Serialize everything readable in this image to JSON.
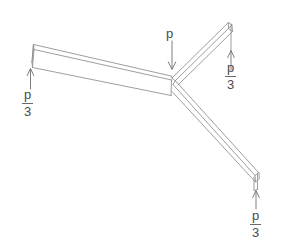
{
  "figure": {
    "type": "engineering-free-body-diagram",
    "title": "",
    "background_color": "#ffffff",
    "line_color": "#8c8c8c",
    "text_color": "#4a4a4a"
  },
  "load": {
    "label": "p",
    "direction": "down",
    "arrow_glyph": "↓"
  },
  "reactions": [
    {
      "id": "left",
      "numerator": "p",
      "denominator": "3",
      "direction": "up",
      "arrow_glyph": "↑"
    },
    {
      "id": "upper-right",
      "numerator": "p",
      "denominator": "3",
      "direction": "up",
      "arrow_glyph": "↑"
    },
    {
      "id": "lower-right",
      "numerator": "p",
      "denominator": "3",
      "direction": "up",
      "arrow_glyph": "↑"
    }
  ]
}
